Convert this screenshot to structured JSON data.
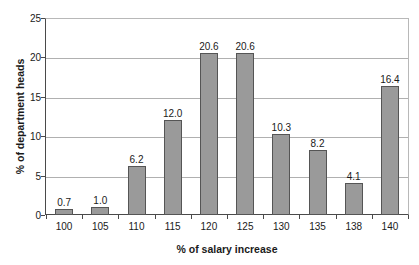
{
  "chart_data": {
    "type": "bar",
    "title": "",
    "xlabel": "% of salary increase",
    "ylabel": "% of department heads",
    "categories": [
      "100",
      "105",
      "110",
      "115",
      "120",
      "125",
      "130",
      "135",
      "138",
      "140"
    ],
    "values": [
      0.7,
      1.0,
      6.2,
      12.0,
      20.6,
      20.6,
      10.3,
      8.2,
      4.1,
      16.4
    ],
    "value_labels": [
      "0.7",
      "1.0",
      "6.2",
      "12.0",
      "20.6",
      "20.6",
      "10.3",
      "8.2",
      "4.1",
      "16.4"
    ],
    "ylim": [
      0,
      25
    ],
    "yticks": [
      0,
      5,
      10,
      15,
      20,
      25
    ],
    "ytick_labels": [
      "0",
      "5",
      "10",
      "15",
      "20",
      "25"
    ],
    "grid": true,
    "legend": false,
    "legend_position": "none",
    "colors": {
      "bar_fill": "#9a9a9a",
      "bar_border": "#555555",
      "gridline": "#b0b0b0",
      "axis": "#4a4a4a",
      "text": "#1a1a1a",
      "background": "#ffffff"
    }
  }
}
